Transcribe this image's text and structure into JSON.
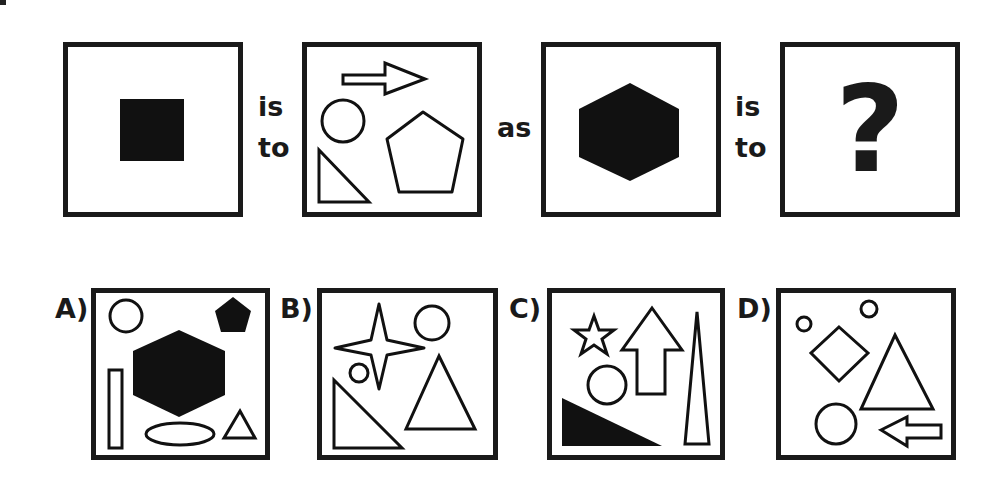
{
  "question": {
    "connectors": {
      "is_to_1": [
        "is",
        "to"
      ],
      "as": "as",
      "is_to_2": [
        "is",
        "to"
      ]
    },
    "panels": [
      {
        "id": "q1",
        "shapes": [
          "filled-square"
        ]
      },
      {
        "id": "q2",
        "shapes": [
          "outline-arrow-right",
          "outline-circle",
          "outline-pentagon",
          "outline-right-triangle"
        ]
      },
      {
        "id": "q3",
        "shapes": [
          "filled-hexagon"
        ]
      },
      {
        "id": "q4",
        "symbol": "?"
      }
    ]
  },
  "options": [
    {
      "label": "A)",
      "shapes": [
        "outline-circle",
        "filled-hexagon",
        "filled-pentagon",
        "outline-rectangle",
        "outline-ellipse",
        "outline-triangle"
      ]
    },
    {
      "label": "B)",
      "shapes": [
        "outline-four-point-star",
        "outline-circle",
        "outline-small-circle",
        "outline-right-triangle",
        "outline-triangle"
      ]
    },
    {
      "label": "C)",
      "shapes": [
        "outline-star",
        "outline-arrow-up",
        "outline-thin-triangle",
        "outline-circle",
        "filled-right-triangle"
      ]
    },
    {
      "label": "D)",
      "shapes": [
        "outline-small-circle",
        "outline-small-circle",
        "outline-diamond",
        "outline-triangle",
        "outline-circle",
        "outline-arrow-left"
      ]
    }
  ],
  "colors": {
    "ink": "#1a1a1a",
    "background": "#ffffff"
  }
}
